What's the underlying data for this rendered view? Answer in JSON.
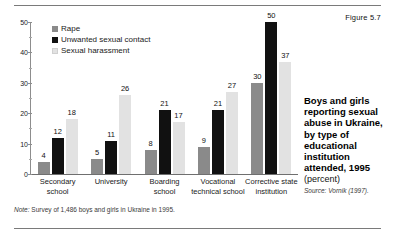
{
  "figure_number": "Figure 5.7",
  "caption": {
    "title": "Boys and girls reporting sexual abuse in Ukraine, by type of educational institution attended, 1995",
    "unit": "(percent)",
    "source": "Source: Vornik (1997)."
  },
  "note": {
    "label": "Note:",
    "text": " Survey of 1,486 boys and girls in Ukraine in 1995."
  },
  "colors": {
    "rape": "#8a8a8a",
    "unwanted_sexual_contact": "#111111",
    "sexual_harassment": "#e2e2e2",
    "axis": "#8d8d8d",
    "rule": "#7a7a7a"
  },
  "chart_data": {
    "type": "bar",
    "title": "Boys and girls reporting sexual abuse in Ukraine, by type of educational institution attended, 1995",
    "xlabel": "",
    "ylabel": "",
    "unit": "percent",
    "ylim": [
      0,
      50
    ],
    "yticks": [
      0,
      10,
      20,
      30,
      40,
      50
    ],
    "ytick_labels": [
      "0",
      "10",
      "20",
      "30",
      "40",
      "50"
    ],
    "minor_tick_interval": 5,
    "grid": false,
    "legend_position": "top-left",
    "categories": [
      "Secondary school",
      "University",
      "Boarding school",
      "Vocational technical school",
      "Corrective state institution"
    ],
    "series": [
      {
        "name": "Rape",
        "color": "#8a8a8a",
        "values": [
          4,
          5,
          8,
          9,
          30
        ]
      },
      {
        "name": "Unwanted sexual contact",
        "color": "#111111",
        "values": [
          12,
          11,
          21,
          21,
          50
        ]
      },
      {
        "name": "Sexual harassment",
        "color": "#e2e2e2",
        "values": [
          18,
          26,
          17,
          27,
          37
        ]
      }
    ]
  }
}
